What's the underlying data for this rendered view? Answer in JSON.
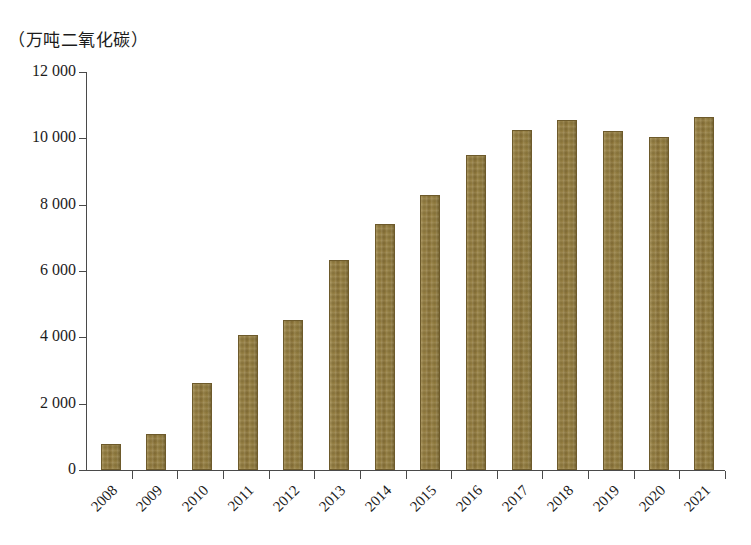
{
  "chart_data": {
    "type": "bar",
    "title": "",
    "subtitle": "",
    "unit_label": "（万吨二氧化碳）",
    "xlabel": "",
    "ylabel": "",
    "categories": [
      "2008",
      "2009",
      "2010",
      "2011",
      "2012",
      "2013",
      "2014",
      "2015",
      "2016",
      "2017",
      "2018",
      "2019",
      "2020",
      "2021"
    ],
    "values": [
      780,
      1080,
      2620,
      4080,
      4510,
      6340,
      7420,
      8300,
      9500,
      10240,
      10560,
      10210,
      10030,
      10640
    ],
    "series": [
      {
        "name": "万吨二氧化碳",
        "values": [
          780,
          1080,
          2620,
          4080,
          4510,
          6340,
          7420,
          8300,
          9500,
          10240,
          10560,
          10210,
          10030,
          10640
        ]
      }
    ],
    "ylim": [
      0,
      12000
    ],
    "ytick_values": [
      0,
      2000,
      4000,
      6000,
      8000,
      10000,
      12000
    ],
    "ytick_labels": [
      "0",
      "2 000",
      "4 000",
      "6 000",
      "8 000",
      "10 000",
      "12 000"
    ],
    "grid": false,
    "legend": false,
    "legend_position": "none",
    "bar_color": "#8e7739",
    "axis_color": "#4a4a4a",
    "background_color": "#ffffff",
    "xtick_rotation_deg": -45
  }
}
